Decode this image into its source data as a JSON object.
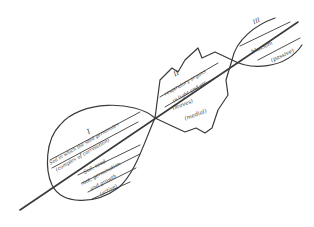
{
  "diagram": {
    "type": "hand-drawn plant growth stages along an axis",
    "lobes": [
      {
        "numeral": "I",
        "upper": [
          "Soil in which the seed germinates",
          "(complex of correlation)"
        ],
        "lower": [
          "Soil, seed",
          "root, germination",
          "and growth",
          "(active)"
        ]
      },
      {
        "numeral": "II",
        "upper": [
          "respiratory organs",
          "in light and air"
        ],
        "lower": [
          "(leaves)",
          "(medial)"
        ]
      },
      {
        "numeral": "III",
        "upper": [
          "blossom"
        ],
        "lower": [
          "(passive)"
        ]
      }
    ],
    "ink_color": "#3a3a3a"
  }
}
